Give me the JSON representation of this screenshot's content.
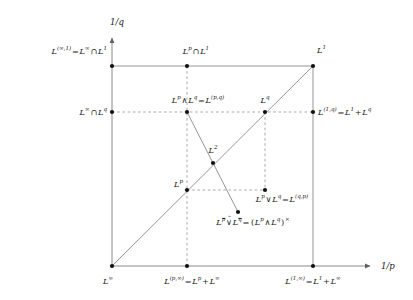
{
  "figure": {
    "width": 413,
    "height": 300,
    "colors": {
      "ink": "#1a1a1a",
      "solid_line": "#8a8a8a",
      "dashed_line": "#9a9a9a",
      "point": "#111111",
      "background": "#ffffff"
    }
  },
  "axes": {
    "x_label": "1/p",
    "y_label": "1/q",
    "x_origin_px": 112,
    "y_origin_px": 266,
    "x_end_px": 372,
    "y_end_px": 36
  },
  "grid": {
    "x_ticks_px": [
      112,
      187,
      265,
      313
    ],
    "y_ticks_px": [
      266,
      190,
      112,
      66
    ]
  },
  "points": [
    {
      "id": "p-infty-1",
      "x": 112,
      "y": 66,
      "name": "L-infty-cap-L1-point"
    },
    {
      "id": "p-p-cap-1",
      "x": 187,
      "y": 66,
      "name": "Lp-cap-L1-point"
    },
    {
      "id": "p-L1",
      "x": 313,
      "y": 66,
      "name": "L1-point"
    },
    {
      "id": "p-infty-q",
      "x": 112,
      "y": 112,
      "name": "L-infty-cap-Lq-point"
    },
    {
      "id": "p-wedge",
      "x": 187,
      "y": 112,
      "name": "Lp-wedge-Lq-point"
    },
    {
      "id": "p-Lq",
      "x": 265,
      "y": 112,
      "name": "Lq-point"
    },
    {
      "id": "p-1q",
      "x": 313,
      "y": 112,
      "name": "L1-plus-Lq-point"
    },
    {
      "id": "p-L2",
      "x": 213,
      "y": 163,
      "name": "L2-point"
    },
    {
      "id": "p-Lp",
      "x": 187,
      "y": 190,
      "name": "Lp-point"
    },
    {
      "id": "p-vee",
      "x": 265,
      "y": 190,
      "name": "Lp-vee-Lq-point"
    },
    {
      "id": "p-dual",
      "x": 238,
      "y": 212,
      "name": "Lp-tilde-vee-Lq-point"
    },
    {
      "id": "p-Linfty",
      "x": 112,
      "y": 266,
      "name": "L-infty-point"
    },
    {
      "id": "p-p-infty",
      "x": 187,
      "y": 266,
      "name": "Lp-plus-L-infty-point"
    },
    {
      "id": "p-1-infty",
      "x": 313,
      "y": 266,
      "name": "L1-plus-L-infty-point"
    }
  ],
  "labels": {
    "y_axis": "1/q",
    "x_axis": "1/p",
    "top_left": "L^{(∞,1)} = L^∞ ∩ L^1",
    "top_mid": "L^p ∩ L^1",
    "top_right": "L^1",
    "mid_left": "L^∞ ∩ L^q",
    "mid_wedge": "L^p ∧ L^q = L^{(p,q)}",
    "mid_q": "L^q",
    "mid_right": "L^{(1,q)} = L^1 + L^q",
    "l2": "L^2",
    "lp": "L^p",
    "vee": "L^p ∨ L^q = L^{(q,p)}",
    "dual": "L^{\\bar p} ∨̃ L^{\\bar q} = (L^p ∧ L^q)^×",
    "bottom_left": "L^∞",
    "bottom_mid": "L^{(p,∞)} = L^p + L^∞",
    "bottom_right": "L^{(1,∞)} = L^1 + L^∞"
  },
  "label_parts": {
    "top_left": {
      "base1": "L",
      "sup1": "(∞,1)",
      "op": "=",
      "base2": "L",
      "sup2": "∞",
      "cap": "∩",
      "base3": "L",
      "sup3": "1"
    },
    "top_mid": {
      "base1": "L",
      "sup1": "p",
      "cap": "∩",
      "base2": "L",
      "sup2": "1"
    },
    "top_right": {
      "base1": "L",
      "sup1": "1"
    },
    "mid_left": {
      "base1": "L",
      "sup1": "∞",
      "cap": "∩",
      "base2": "L",
      "sup2": "q"
    },
    "mid_wedge": {
      "base1": "L",
      "sup1": "p",
      "wedge": "∧",
      "base2": "L",
      "sup2": "q",
      "eq": "=",
      "base3": "L",
      "sup3": "(p,q)"
    },
    "mid_q": {
      "base1": "L",
      "sup1": "q"
    },
    "mid_right": {
      "base1": "L",
      "sup1": "(1,q)",
      "eq": "=",
      "base2": "L",
      "sup2": "1",
      "plus": "+",
      "base3": "L",
      "sup3": "q"
    },
    "l2": {
      "base1": "L",
      "sup1": "2"
    },
    "lp": {
      "base1": "L",
      "sup1": "p"
    },
    "vee": {
      "base1": "L",
      "sup1": "p",
      "vee": "∨",
      "base2": "L",
      "sup2": "q",
      "eq": "=",
      "base3": "L",
      "sup3": "(q,p)"
    },
    "dual": {
      "base1": "L",
      "sup1": "p",
      "veetilde": "∨",
      "base2": "L",
      "sup2": "q",
      "eq": "=",
      "open": "(",
      "base3": "L",
      "sup3": "p",
      "wedge": "∧",
      "base4": "L",
      "sup4": "q",
      "close": ")",
      "supx": "×"
    },
    "bottom_left": {
      "base1": "L",
      "sup1": "∞"
    },
    "bottom_mid": {
      "base1": "L",
      "sup1": "(p,∞)",
      "eq": "=",
      "base2": "L",
      "sup2": "p",
      "plus": "+",
      "base3": "L",
      "sup3": "∞"
    },
    "bottom_right": {
      "base1": "L",
      "sup1": "(1,∞)",
      "eq": "=",
      "base2": "L",
      "sup2": "1",
      "plus": "+",
      "base3": "L",
      "sup3": "∞"
    }
  }
}
